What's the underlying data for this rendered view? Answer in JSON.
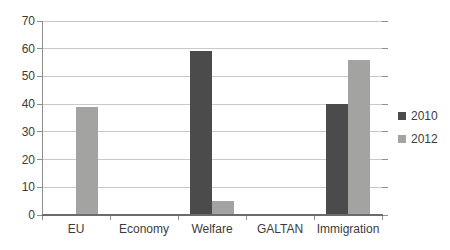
{
  "chart_data": {
    "type": "bar",
    "categories": [
      "EU",
      "Economy",
      "Welfare",
      "GALTAN",
      "Immigration"
    ],
    "series": [
      {
        "name": "2010",
        "color": "#4b4b4b",
        "values": [
          0,
          0,
          59,
          0,
          40
        ]
      },
      {
        "name": "2012",
        "color": "#a3a3a1",
        "values": [
          39,
          0,
          5,
          0,
          56
        ]
      }
    ],
    "title": "",
    "xlabel": "",
    "ylabel": "",
    "ylim": [
      0,
      70
    ],
    "yticks": [
      0,
      10,
      20,
      30,
      40,
      50,
      60,
      70
    ],
    "grid": true,
    "legend_position": "right"
  },
  "colors": {
    "background": "#ffffff",
    "gridline": "#c9c9c9",
    "axis": "#8f8f8f",
    "axis_bottom": "#6b6b6b",
    "text": "#3c3c3c"
  }
}
